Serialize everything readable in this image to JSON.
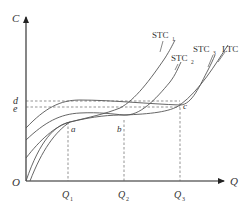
{
  "diagram": {
    "type": "economics-cost-curves",
    "axes": {
      "y_label": "C",
      "x_label": "Q",
      "origin_label": "O"
    },
    "x_ticks": [
      {
        "main": "Q",
        "sub": "1"
      },
      {
        "main": "Q",
        "sub": "2"
      },
      {
        "main": "Q",
        "sub": "3"
      }
    ],
    "y_ticks": [
      {
        "label": "d"
      },
      {
        "label": "e"
      }
    ],
    "points": [
      {
        "label": "a"
      },
      {
        "label": "b"
      },
      {
        "label": "c"
      }
    ],
    "curves": [
      {
        "main": "STC",
        "sub": "1"
      },
      {
        "main": "STC",
        "sub": "2"
      },
      {
        "main": "STC",
        "sub": "3"
      },
      {
        "main": "LTC",
        "sub": ""
      }
    ],
    "colors": {
      "axis": "#222222",
      "curve": "#555555",
      "dashed": "#666666",
      "text": "#333333"
    }
  }
}
